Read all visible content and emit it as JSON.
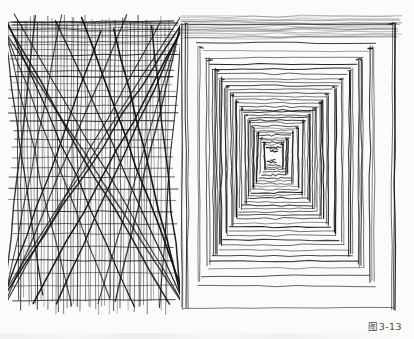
{
  "page": {
    "background_color": "#fbfbf9",
    "ink_color": "#1a1a1a",
    "width": 414,
    "height": 339,
    "media": "scanned pen-and-ink textbook page"
  },
  "figure": {
    "caption": "图3-13",
    "caption_color": "#4a4a4a"
  },
  "plates": [
    {
      "id": "left",
      "name": "crosshatch-grid-study",
      "description": "Freehand ruled study: dense horizontal rules at top, continuous vertical rules full height, and two families of long diagonal strokes crossing at roughly +/-55 degrees.",
      "frame": {
        "x": 8,
        "y": 10,
        "width": 172,
        "height": 305
      },
      "drawing_box": {
        "x": 10,
        "y": 12,
        "width": 150,
        "height": 278
      },
      "line_families": [
        {
          "name": "horizontals",
          "count": 40,
          "note": "tightly spaced near the top, thinning toward the bottom"
        },
        {
          "name": "verticals",
          "count": 46,
          "note": "evenly spaced, spanning the full height"
        },
        {
          "name": "diagonals-right",
          "count": 14,
          "angle_deg": -55
        },
        {
          "name": "diagonals-left",
          "count": 13,
          "angle_deg": 55
        }
      ]
    },
    {
      "id": "right",
      "name": "one-point-perspective-corridor",
      "description": "One-point perspective colonnade/corridor. Horizontal ceiling and floor rules converge on a single vanishing point; vertical pillars recede along both side walls.",
      "frame": {
        "x": 180,
        "y": 8,
        "width": 222,
        "height": 308
      },
      "vanishing_point": {
        "x": 92,
        "y": 147
      },
      "ceiling_rules": 34,
      "floor_rules": 34,
      "left_pillars": 15,
      "right_pillars": 15,
      "opening": {
        "top": 16,
        "bottom": 300,
        "left": 4,
        "right": 214
      }
    }
  ],
  "chart_data": {
    "type": "line",
    "title": "图3-13",
    "xlabel": "",
    "ylabel": "",
    "series": [
      {
        "name": "left-plate-horizontals",
        "values": [
          40
        ]
      },
      {
        "name": "left-plate-verticals",
        "values": [
          46
        ]
      },
      {
        "name": "left-plate-diagonals",
        "values": [
          27
        ]
      },
      {
        "name": "corridor-ceiling-rules",
        "values": [
          34
        ]
      },
      {
        "name": "corridor-floor-rules",
        "values": [
          34
        ]
      },
      {
        "name": "corridor-pillars",
        "values": [
          30
        ]
      }
    ]
  }
}
